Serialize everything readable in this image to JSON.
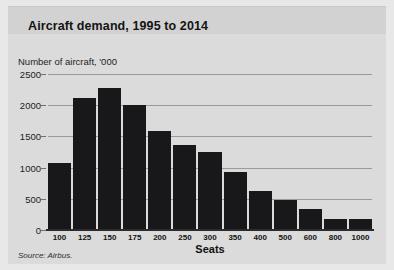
{
  "card": {
    "title": "Aircraft demand, 1995 to 2014",
    "source": "Source: Airbus."
  },
  "colors": {
    "bar": "#18181a",
    "grid": "#9a9a9a",
    "axis": "#2b2b2b",
    "title_band": "#d2d2d2",
    "body_band": "#dbdbdb",
    "text": "#141414"
  },
  "chart_data": {
    "type": "bar",
    "title": "Aircraft demand, 1995 to 2014",
    "subtitle": "Number of aircraft, '000",
    "xlabel": "Seats",
    "ylabel": "Number of aircraft, '000",
    "categories": [
      "100",
      "125",
      "150",
      "175",
      "200",
      "250",
      "300",
      "350",
      "400",
      "500",
      "600",
      "800",
      "1000"
    ],
    "values": [
      1080,
      2120,
      2280,
      2000,
      1580,
      1370,
      1250,
      930,
      620,
      480,
      340,
      180,
      180
    ],
    "ylim": [
      0,
      2500
    ],
    "yticks": [
      0,
      500,
      1000,
      1500,
      2000,
      2500
    ],
    "ytick_labels": [
      "0",
      "500",
      "1000",
      "1500",
      "2000",
      "2500"
    ],
    "grid": true,
    "legend": false,
    "source": "Source: Airbus."
  }
}
